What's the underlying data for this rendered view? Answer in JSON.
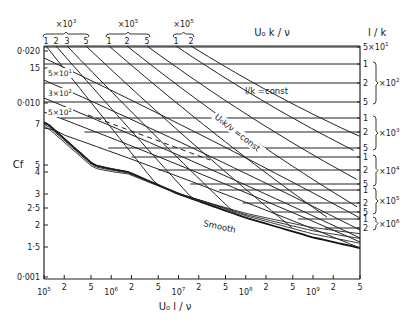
{
  "chart_data": {
    "type": "line",
    "title": "",
    "xlabel": "U0 l / ν",
    "ylabel": "Cf",
    "x_scale": "log",
    "y_scale": "log",
    "xlim": [
      100000,
      5000000000
    ],
    "ylim": [
      0.001,
      0.02
    ],
    "grid": false,
    "x_ticks": [
      {
        "value": 100000,
        "label": "10^5"
      },
      {
        "value": 200000,
        "label": "2"
      },
      {
        "value": 500000,
        "label": "5"
      },
      {
        "value": 1000000,
        "label": "10^6"
      },
      {
        "value": 2000000,
        "label": "2"
      },
      {
        "value": 5000000,
        "label": "5"
      },
      {
        "value": 10000000,
        "label": "10^7"
      },
      {
        "value": 20000000,
        "label": "2"
      },
      {
        "value": 50000000,
        "label": "5"
      },
      {
        "value": 100000000,
        "label": "10^8"
      },
      {
        "value": 200000000,
        "label": "2"
      },
      {
        "value": 500000000,
        "label": "5"
      },
      {
        "value": 1000000000,
        "label": "10^9"
      },
      {
        "value": 2000000000,
        "label": "2"
      },
      {
        "value": 5000000000,
        "label": "5"
      }
    ],
    "y_ticks": [
      {
        "value": 0.02,
        "label": "0·020"
      },
      {
        "value": 0.015,
        "label": "15"
      },
      {
        "value": 0.01,
        "label": "0·010"
      },
      {
        "value": 0.007,
        "label": "7"
      },
      {
        "value": 0.005,
        "label": "5"
      },
      {
        "value": 0.004,
        "label": "4"
      },
      {
        "value": 0.003,
        "label": "3"
      },
      {
        "value": 0.0025,
        "label": "2·5"
      },
      {
        "value": 0.002,
        "label": "2"
      },
      {
        "value": 0.0015,
        "label": "1·5"
      },
      {
        "value": 0.001,
        "label": "0·001"
      }
    ],
    "top_axis": {
      "title": "U0 k / ν",
      "groups": [
        {
          "multiplier": "×10^3",
          "labels": [
            "1",
            "2",
            "3",
            "5"
          ]
        },
        {
          "multiplier": "×10^5",
          "labels": [
            "1",
            "2",
            "5"
          ]
        },
        {
          "multiplier": "×10^5",
          "labels": [
            "1",
            "2"
          ]
        }
      ]
    },
    "right_axis": {
      "title": "l / k",
      "groups": [
        {
          "multiplier": "",
          "labels": [
            "5×10^1"
          ]
        },
        {
          "multiplier": "×10^2",
          "labels": [
            "1",
            "2",
            "5"
          ]
        },
        {
          "multiplier": "×10^3",
          "labels": [
            "1",
            "2",
            "5"
          ]
        },
        {
          "multiplier": "×10^4",
          "labels": [
            "1",
            "2",
            "5"
          ]
        },
        {
          "multiplier": "×10^5",
          "labels": [
            "1",
            "2",
            "5"
          ]
        },
        {
          "multiplier": "×10^6",
          "labels": [
            "1",
            "2"
          ]
        }
      ]
    },
    "left_inset_labels": [
      "5×10^1",
      "3×10^2",
      "5×10^2"
    ],
    "annotations": [
      "l/k = const",
      "U0k/ν = const",
      "Smooth"
    ],
    "series": [
      {
        "name": "Smooth",
        "x": [
          100000,
          1000000,
          10000000,
          100000000,
          1000000000,
          5000000000
        ],
        "y": [
          0.0072,
          0.0044,
          0.003,
          0.0022,
          0.0017,
          0.00148
        ]
      },
      {
        "name": "l/k = 5×10^1",
        "x": [
          100000,
          5000000000
        ],
        "y": [
          0.0195,
          0.0195
        ]
      },
      {
        "name": "l/k = 1×10^2",
        "x": [
          100000,
          5000000000
        ],
        "y": [
          0.0155,
          0.0155
        ]
      },
      {
        "name": "l/k = 2×10^2",
        "x": [
          100000,
          5000000000
        ],
        "y": [
          0.0128,
          0.0128
        ]
      },
      {
        "name": "l/k = 5×10^2",
        "x": [
          100000,
          5000000000
        ],
        "y": [
          0.0102,
          0.0102
        ]
      },
      {
        "name": "l/k = 1×10^3",
        "x": [
          180000,
          5000000000
        ],
        "y": [
          0.0088,
          0.0088
        ]
      },
      {
        "name": "l/k = 2×10^3",
        "x": [
          400000,
          5000000000
        ],
        "y": [
          0.0077,
          0.0077
        ]
      },
      {
        "name": "l/k = 5×10^3",
        "x": [
          900000,
          5000000000
        ],
        "y": [
          0.0064,
          0.0064
        ]
      },
      {
        "name": "l/k = 1×10^4",
        "x": [
          2000000,
          5000000000
        ],
        "y": [
          0.0058,
          0.0058
        ]
      },
      {
        "name": "l/k = 2×10^4",
        "x": [
          5000000,
          5000000000
        ],
        "y": [
          0.0051,
          0.0051
        ]
      },
      {
        "name": "l/k = 5×10^4",
        "x": [
          15000000,
          5000000000
        ],
        "y": [
          0.0043,
          0.0043
        ]
      },
      {
        "name": "l/k = 1×10^5",
        "x": [
          40000000,
          5000000000
        ],
        "y": [
          0.0038,
          0.0038
        ]
      },
      {
        "name": "l/k = 2×10^5",
        "x": [
          90000000,
          5000000000
        ],
        "y": [
          0.0034,
          0.0034
        ]
      },
      {
        "name": "l/k = 5×10^5",
        "x": [
          250000000,
          5000000000
        ],
        "y": [
          0.003,
          0.003
        ]
      },
      {
        "name": "l/k = 1×10^6",
        "x": [
          600000000,
          5000000000
        ],
        "y": [
          0.0028,
          0.0028
        ]
      },
      {
        "name": "l/k = 2×10^6",
        "x": [
          1500000000,
          5000000000
        ],
        "y": [
          0.0025,
          0.0025
        ]
      }
    ]
  },
  "labels": {
    "x_axis_title": "U₀ l / ν",
    "y_axis_title": "Cf",
    "top_axis_title": "U₀ k / ν",
    "right_axis_title": "l / k",
    "annot_lk": "l/k  =const",
    "annot_u0k": "U₀k/ν =const",
    "annot_smooth": "Smooth"
  }
}
